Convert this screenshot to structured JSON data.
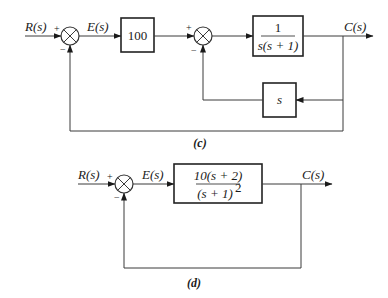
{
  "diagram_c": {
    "caption": "(c)",
    "input_label": "R(s)",
    "error_label": "E(s)",
    "output_label": "C(s)",
    "sum1": {
      "plus": "+",
      "minus": "−"
    },
    "sum2": {
      "plus": "+",
      "minus": "−"
    },
    "gain_block": "100",
    "plant_block": {
      "numerator": "1",
      "denominator": "s(s + 1)"
    },
    "feedback_block": "s"
  },
  "diagram_d": {
    "caption": "(d)",
    "input_label": "R(s)",
    "error_label": "E(s)",
    "output_label": "C(s)",
    "sum": {
      "plus": "+",
      "minus": "−"
    },
    "plant_block": {
      "numerator": "10(s + 2)",
      "denominator": "(s + 1)",
      "denominator_exponent": "2"
    }
  },
  "colors": {
    "line": "#3a3a3a",
    "text": "#1a1a1a",
    "background": "#ffffff"
  }
}
